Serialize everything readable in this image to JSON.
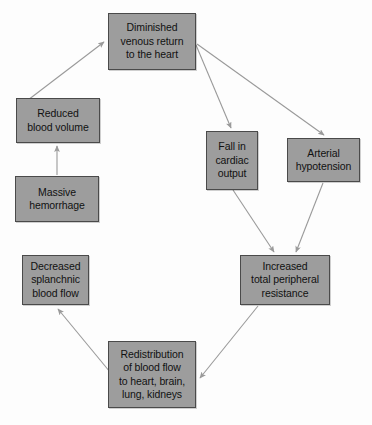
{
  "diagram": {
    "background_color": "#fdfdfd",
    "box_fill_color": "#9d9d9d",
    "box_border_color": "#4a4a4a",
    "arrow_color": "#9a9a9a",
    "text_color": "#111111",
    "nodes": [
      {
        "id": "diminished-venous-return",
        "label": "Diminished\nvenous return\nto the heart",
        "x": 108,
        "y": 13,
        "width": 88,
        "height": 57
      },
      {
        "id": "reduced-blood-volume",
        "label": "Reduced\nblood volume",
        "x": 16,
        "y": 98,
        "width": 84,
        "height": 45
      },
      {
        "id": "massive-hemorrhage",
        "label": "Massive\nhemorrhage",
        "x": 15,
        "y": 176,
        "width": 84,
        "height": 46
      },
      {
        "id": "fall-in-cardiac-output",
        "label": "Fall in\ncardiac\noutput",
        "x": 206,
        "y": 131,
        "width": 52,
        "height": 59
      },
      {
        "id": "arterial-hypotension",
        "label": "Arterial\nhypotension",
        "x": 287,
        "y": 138,
        "width": 73,
        "height": 44
      },
      {
        "id": "increased-total-peripheral-resistance",
        "label": "Increased\ntotal peripheral\nresistance",
        "x": 240,
        "y": 255,
        "width": 90,
        "height": 50
      },
      {
        "id": "decreased-splanchnic-blood-flow",
        "label": "Decreased\nsplanchnic\nblood flow",
        "x": 22,
        "y": 255,
        "width": 67,
        "height": 50
      },
      {
        "id": "redistribution-of-blood-flow",
        "label": "Redistribution\nof blood flow\nto heart, brain,\nlung, kidneys",
        "x": 108,
        "y": 341,
        "width": 88,
        "height": 67
      }
    ],
    "edges": [
      {
        "id": "massive-hemorrhage-to-reduced-blood-volume",
        "from": "massive-hemorrhage",
        "to": "reduced-blood-volume",
        "path": "M 57,175 L 57,146"
      },
      {
        "id": "reduced-blood-volume-to-diminished-venous-return",
        "from": "reduced-blood-volume",
        "to": "diminished-venous-return",
        "path": "M 28,100 L 104,42"
      },
      {
        "id": "diminished-venous-return-to-fall-in-cardiac-output",
        "from": "diminished-venous-return",
        "to": "fall-in-cardiac-output",
        "path": "M 196,45 L 231,128"
      },
      {
        "id": "diminished-venous-return-to-arterial-hypotension",
        "from": "diminished-venous-return",
        "to": "arterial-hypotension",
        "path": "M 197,44 L 324,135"
      },
      {
        "id": "fall-in-cardiac-output-to-increased-resistance",
        "from": "fall-in-cardiac-output",
        "to": "increased-total-peripheral-resistance",
        "path": "M 233,190 L 274,252"
      },
      {
        "id": "arterial-hypotension-to-increased-resistance",
        "from": "arterial-hypotension",
        "to": "increased-total-peripheral-resistance",
        "path": "M 323,183 L 296,252"
      },
      {
        "id": "increased-resistance-to-redistribution",
        "from": "increased-total-peripheral-resistance",
        "to": "redistribution-of-blood-flow",
        "path": "M 258,306 L 200,378"
      },
      {
        "id": "redistribution-to-decreased-splanchnic",
        "from": "redistribution-of-blood-flow",
        "to": "decreased-splanchnic-blood-flow",
        "path": "M 110,372 L 58,309"
      }
    ]
  }
}
